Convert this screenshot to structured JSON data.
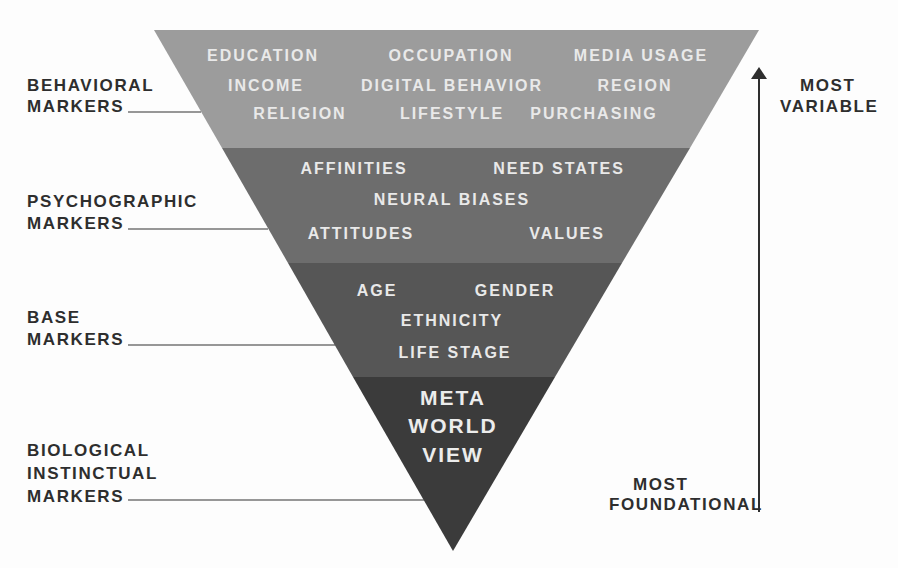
{
  "diagram": {
    "type": "inverted-pyramid",
    "colors": {
      "behavioral_layer": "#9c9c9c",
      "psychographic_layer": "#6d6d6d",
      "base_layer": "#565656",
      "core_layer": "#3b3b3b",
      "layer_text": "#e9e9e9",
      "label_text": "#2e2e2e"
    },
    "layers": [
      {
        "label": [
          "BEHAVIORAL",
          "MARKERS"
        ],
        "items": [
          "EDUCATION",
          "OCCUPATION",
          "MEDIA USAGE",
          "INCOME",
          "DIGITAL BEHAVIOR",
          "REGION",
          "RELIGION",
          "LIFESTYLE",
          "PURCHASING"
        ]
      },
      {
        "label": [
          "PSYCHOGRAPHIC",
          "MARKERS"
        ],
        "items": [
          "AFFINITIES",
          "NEED STATES",
          "NEURAL BIASES",
          "ATTITUDES",
          "VALUES"
        ]
      },
      {
        "label": [
          "BASE",
          "MARKERS"
        ],
        "items": [
          "AGE",
          "GENDER",
          "ETHNICITY",
          "LIFE STAGE"
        ]
      },
      {
        "label": [
          "BIOLOGICAL",
          "INSTINCTUAL",
          "MARKERS"
        ],
        "items": [
          "META",
          "WORLD",
          "VIEW"
        ]
      }
    ],
    "axis": {
      "top": [
        "MOST",
        "VARIABLE"
      ],
      "bottom": [
        "MOST",
        "FOUNDATIONAL"
      ],
      "direction": "up-arrow"
    }
  }
}
